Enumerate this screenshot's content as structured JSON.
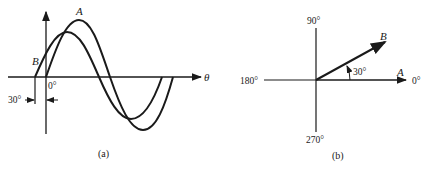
{
  "figure_a": {
    "caption": "(a)",
    "axis_label": "θ",
    "origin_label": "0°",
    "curve_a_label": "A",
    "curve_b_label": "B",
    "phase_shift_label": "30°"
  },
  "figure_b": {
    "caption": "(b)",
    "angle_labels": {
      "top": "90°",
      "left": "180°",
      "bottom": "270°",
      "right": "0°"
    },
    "phasor_a_label": "A",
    "phasor_b_label": "B",
    "angle_between_label": "30°"
  },
  "colors": {
    "ink": "#1a1a1a",
    "background": "#ffffff"
  }
}
